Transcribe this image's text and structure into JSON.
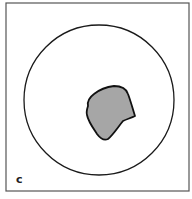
{
  "figure": {
    "panel_label": "c",
    "frame": {
      "x": 6,
      "y": 3,
      "width": 183,
      "height": 188,
      "stroke": "#555555"
    },
    "outer_circle": {
      "cx": 99,
      "cy": 100,
      "r": 75,
      "stroke": "#1a1a1a",
      "fill": "#ffffff"
    },
    "lesion": {
      "fill": "#a6a6a6",
      "stroke": "#111111",
      "path": "M88,106 C87,101 90,97 94,94 C99,90 106,87 114,86 C121,86 126,88 128,94 C131,102 133,110 135,116 C131,118 127,119 123,121 C118,127 113,135 108,139 C104,141 100,138 97,134 C93,128 88,121 87,115 C86,112 87,109 88,106 Z"
    }
  }
}
